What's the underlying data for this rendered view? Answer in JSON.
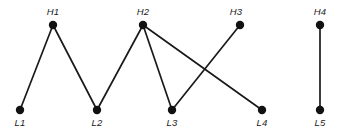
{
  "figure": {
    "title": "",
    "background_color": "#ffffff",
    "width": 348,
    "height": 133
  },
  "chart_data": {
    "type": "scatter",
    "title": "",
    "xlabel": "",
    "ylabel": "",
    "grid": false,
    "legend": null,
    "node_color": "#111111",
    "edge_color": "#1a1a1a",
    "node_radius": 4.2,
    "edge_width": 1.7,
    "rows": {
      "high_y": 25,
      "low_y": 110
    },
    "nodes": [
      {
        "id": "H1",
        "label": "H1",
        "x": 53,
        "y": 25,
        "row": "high",
        "label_x": 53,
        "label_y": 15,
        "label_anchor": "middle"
      },
      {
        "id": "H2",
        "label": "H2",
        "x": 143,
        "y": 25,
        "row": "high",
        "label_x": 143,
        "label_y": 15,
        "label_anchor": "middle"
      },
      {
        "id": "H3",
        "label": "H3",
        "x": 240,
        "y": 25,
        "row": "high",
        "label_x": 236,
        "label_y": 15,
        "label_anchor": "middle"
      },
      {
        "id": "H4",
        "label": "H4",
        "x": 320,
        "y": 25,
        "row": "high",
        "label_x": 320,
        "label_y": 15,
        "label_anchor": "middle"
      },
      {
        "id": "L1",
        "label": "L1",
        "x": 20,
        "y": 110,
        "row": "low",
        "label_x": 20,
        "label_y": 126,
        "label_anchor": "middle"
      },
      {
        "id": "L2",
        "label": "L2",
        "x": 97,
        "y": 110,
        "row": "low",
        "label_x": 97,
        "label_y": 126,
        "label_anchor": "middle"
      },
      {
        "id": "L3",
        "label": "L3",
        "x": 172,
        "y": 110,
        "row": "low",
        "label_x": 172,
        "label_y": 126,
        "label_anchor": "middle"
      },
      {
        "id": "L4",
        "label": "L4",
        "x": 262,
        "y": 110,
        "row": "low",
        "label_x": 262,
        "label_y": 126,
        "label_anchor": "middle"
      },
      {
        "id": "L5",
        "label": "L5",
        "x": 320,
        "y": 110,
        "row": "low",
        "label_x": 320,
        "label_y": 126,
        "label_anchor": "middle"
      }
    ],
    "edges": [
      {
        "id": "L1-H1",
        "source": "L1",
        "target": "H1",
        "x1": 20,
        "y1": 110,
        "x2": 53,
        "y2": 25
      },
      {
        "id": "H1-L2",
        "source": "H1",
        "target": "L2",
        "x1": 53,
        "y1": 25,
        "x2": 97,
        "y2": 110
      },
      {
        "id": "L2-H2",
        "source": "L2",
        "target": "H2",
        "x1": 97,
        "y1": 110,
        "x2": 143,
        "y2": 25
      },
      {
        "id": "H2-L3",
        "source": "H2",
        "target": "L3",
        "x1": 143,
        "y1": 25,
        "x2": 172,
        "y2": 110
      },
      {
        "id": "H2-L4",
        "source": "H2",
        "target": "L4",
        "x1": 143,
        "y1": 25,
        "x2": 262,
        "y2": 110
      },
      {
        "id": "H3-L3",
        "source": "H3",
        "target": "L3",
        "x1": 240,
        "y1": 25,
        "x2": 172,
        "y2": 110
      },
      {
        "id": "H4-L5",
        "source": "H4",
        "target": "L5",
        "x1": 320,
        "y1": 25,
        "x2": 320,
        "y2": 110
      }
    ]
  }
}
